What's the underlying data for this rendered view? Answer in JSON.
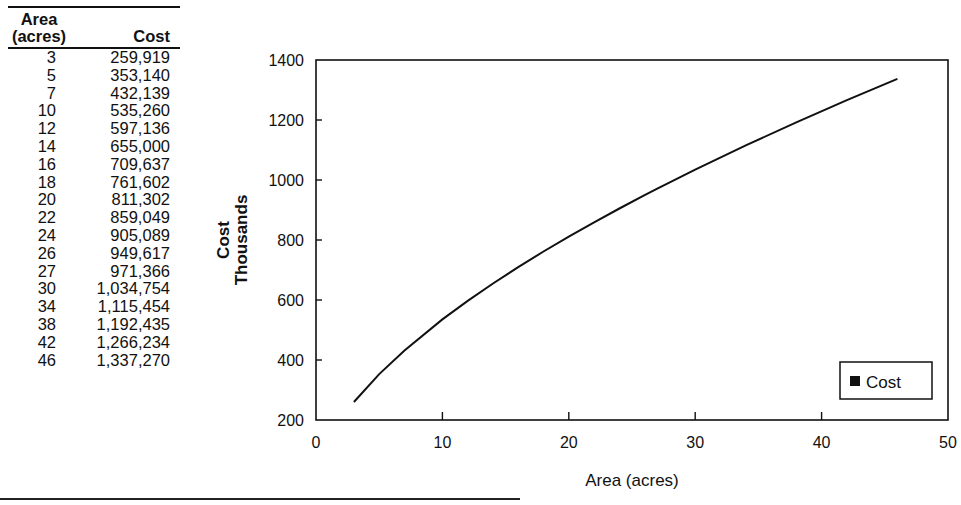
{
  "table": {
    "headers": {
      "area_line1": "Area",
      "area_line2": "(acres)",
      "cost": "Cost"
    },
    "rows": [
      {
        "area": "3",
        "cost": "259,919"
      },
      {
        "area": "5",
        "cost": "353,140"
      },
      {
        "area": "7",
        "cost": "432,139"
      },
      {
        "area": "10",
        "cost": "535,260"
      },
      {
        "area": "12",
        "cost": "597,136"
      },
      {
        "area": "14",
        "cost": "655,000"
      },
      {
        "area": "16",
        "cost": "709,637"
      },
      {
        "area": "18",
        "cost": "761,602"
      },
      {
        "area": "20",
        "cost": "811,302"
      },
      {
        "area": "22",
        "cost": "859,049"
      },
      {
        "area": "24",
        "cost": "905,089"
      },
      {
        "area": "26",
        "cost": "949,617"
      },
      {
        "area": "27",
        "cost": "971,366"
      },
      {
        "area": "30",
        "cost": "1,034,754"
      },
      {
        "area": "34",
        "cost": "1,115,454"
      },
      {
        "area": "38",
        "cost": "1,192,435"
      },
      {
        "area": "42",
        "cost": "1,266,234"
      },
      {
        "area": "46",
        "cost": "1,337,270"
      }
    ]
  },
  "chart_data": {
    "type": "line",
    "title": "",
    "xlabel": "Area (acres)",
    "ylabel_line1": "Cost",
    "ylabel_line2": "Thousands",
    "xlim": [
      0,
      50
    ],
    "ylim": [
      200,
      1400
    ],
    "xticks": [
      "0",
      "10",
      "20",
      "30",
      "40",
      "50"
    ],
    "yticks": [
      "200",
      "400",
      "600",
      "800",
      "1000",
      "1200",
      "1400"
    ],
    "grid": false,
    "legend": {
      "position": "lower-right",
      "entries": [
        "Cost"
      ]
    },
    "x": [
      3,
      5,
      7,
      10,
      12,
      14,
      16,
      18,
      20,
      22,
      24,
      26,
      27,
      30,
      34,
      38,
      42,
      46
    ],
    "series": [
      {
        "name": "Cost",
        "values": [
          259.919,
          353.14,
          432.139,
          535.26,
          597.136,
          655.0,
          709.637,
          761.602,
          811.302,
          859.049,
          905.089,
          949.617,
          971.366,
          1034.754,
          1115.454,
          1192.435,
          1266.234,
          1337.27
        ]
      }
    ]
  }
}
